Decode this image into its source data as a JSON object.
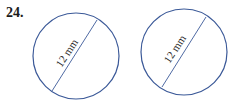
{
  "problem": {
    "number": "24."
  },
  "figures": [
    {
      "label": "12 mm",
      "measure": "diameter"
    },
    {
      "label": "12 mm",
      "measure": "diameter"
    }
  ],
  "colors": {
    "circle_stroke": "#3b5998",
    "line_stroke": "#3b5998",
    "text": "#1a1a1a"
  }
}
